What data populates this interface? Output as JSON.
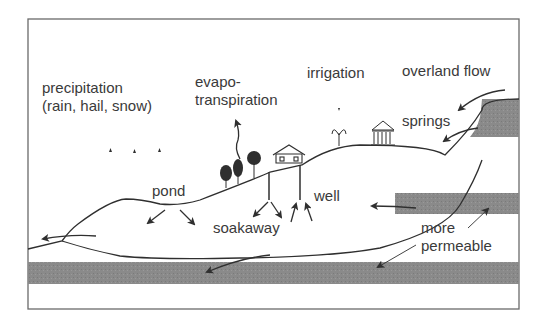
{
  "diagram": {
    "labels": {
      "precipitation_line1": "precipitation",
      "precipitation_line2": "(rain, hail, snow)",
      "evapo_line1": "evapo-",
      "evapo_line2": "transpiration",
      "irrigation": "irrigation",
      "overland_flow": "overland flow",
      "springs": "springs",
      "pond": "pond",
      "well": "well",
      "soakaway": "soakaway",
      "more": "more",
      "permeable": "permeable"
    },
    "colors": {
      "line": "#2f2f2f",
      "text": "#3a3a3a",
      "permeable_layer": "#8a8a8a",
      "frame": "#6a6a6a",
      "background": "#ffffff"
    },
    "icons": [
      "tree-icon",
      "house-icon",
      "fountain-icon",
      "temple-icon",
      "raindrop-icon",
      "arrow-icon"
    ]
  }
}
